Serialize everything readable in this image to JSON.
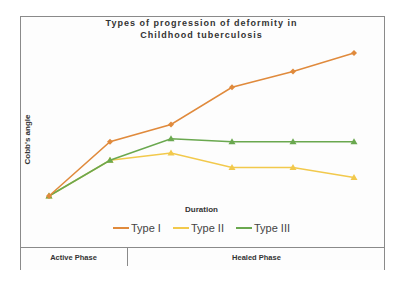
{
  "chart_data": {
    "type": "line",
    "title": "Types of progression of deformity in Childhood tuberculosis",
    "title_lines": [
      "Types of progression of deformity in",
      "Childhood tuberculosis"
    ],
    "xlabel": "Duration",
    "ylabel": "Cobb's angle",
    "x": [
      1,
      2,
      3,
      4,
      5,
      6
    ],
    "grid": false,
    "legend_position": "bottom",
    "ylim": [
      0,
      100
    ],
    "y_units_note": "relative (no numeric axis shown)",
    "series": [
      {
        "name": "Type I",
        "color": "#e08a3c",
        "marker": "diamond",
        "values": [
          0,
          38,
          50,
          76,
          87,
          100
        ]
      },
      {
        "name": "Type II",
        "color": "#f2c94c",
        "marker": "triangle",
        "values": [
          0,
          25,
          30,
          20,
          20,
          13
        ]
      },
      {
        "name": "Type III",
        "color": "#6aa84f",
        "marker": "triangle",
        "values": [
          0,
          25,
          40,
          38,
          38,
          38
        ]
      }
    ],
    "phases": [
      {
        "label": "Active Phase",
        "x_range": [
          1,
          2
        ]
      },
      {
        "label": "Healed Phase",
        "x_range": [
          2,
          6
        ]
      }
    ]
  },
  "legend": [
    {
      "label": "Type I",
      "color": "#e08a3c"
    },
    {
      "label": "Type II",
      "color": "#f2c94c"
    },
    {
      "label": "Type III",
      "color": "#6aa84f"
    }
  ],
  "table": {
    "active": "Active Phase",
    "healed": "Healed Phase"
  }
}
